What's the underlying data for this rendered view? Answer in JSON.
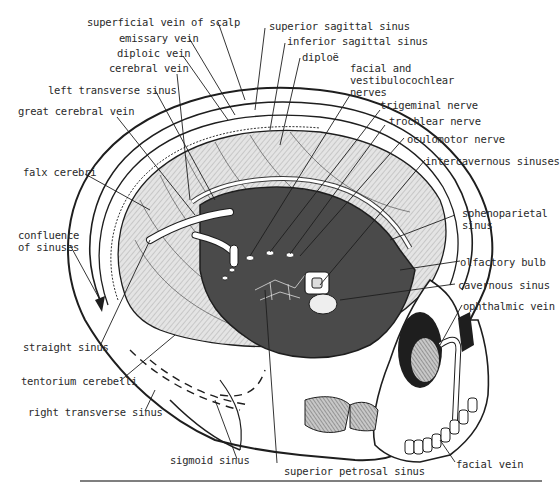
{
  "figure": {
    "top_cutoff_text": "y    p      y  y"
  },
  "labels": {
    "superficial_vein_of_scalp": "superficial vein of scalp",
    "emissary_vein": "emissary vein",
    "diploic_vein": "diploic vein",
    "cerebral_vein": "cerebral vein",
    "left_transverse_sinus": "left transverse sinus",
    "great_cerebral_vein": "great cerebral vein",
    "falx_cerebri": "falx cerebri",
    "confluence_of_sinuses": "confluence\nof sinuses",
    "straight_sinus": "straight sinus",
    "tentorium_cerebelli": "tentorium cerebelli",
    "right_transverse_sinus": "right transverse sinus",
    "sigmoid_sinus": "sigmoid sinus",
    "superior_petrosal_sinus": "superior petrosal sinus",
    "facial_vein": "facial vein",
    "superior_sagittal_sinus": "superior sagittal sinus",
    "inferior_sagittal_sinus": "inferior sagittal sinus",
    "diploe": "diploë",
    "facial_vestibulocochlear": "facial and\nvestibulocochlear\nnerves",
    "trigeminal_nerve": "trigeminal nerve",
    "trochlear_nerve": "trochlear  nerve",
    "oculomotor_nerve": "oculomotor nerve",
    "intercavernous_sinuses": "intercavernous sinuses",
    "sphenoparietal_sinus": "sphenoparietal\nsinus",
    "olfactory_bulb": "olfactory bulb",
    "cavernous_sinus": "cavernous sinus",
    "ophthalmic_vein": "ophthalmic vein"
  },
  "colors": {
    "ink": "#1e1e1e",
    "dark_fill": "#4a4a4a",
    "hatch_fill": "#d6d6d6",
    "paper": "#ffffff"
  }
}
